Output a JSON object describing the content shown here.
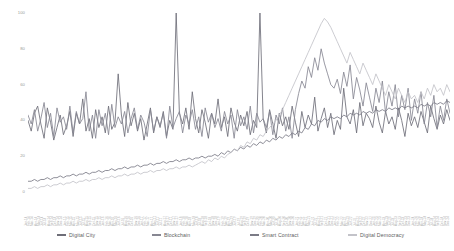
{
  "chart_data": {
    "type": "line",
    "title": "",
    "subtitle": "",
    "xlabel": "",
    "ylabel": "",
    "ylim": [
      0,
      100
    ],
    "yticks": [
      0,
      20,
      40,
      60,
      80,
      100
    ],
    "ytick_labels": [
      "0",
      "20",
      "40",
      "60",
      "80",
      "100"
    ],
    "grid": false,
    "legend_position": "bottom",
    "x": [
      "Jan-14",
      "Feb-14",
      "Mar-14",
      "Apr-14",
      "May-14",
      "Jun-14",
      "Jul-14",
      "Aug-14",
      "Sep-14",
      "Oct-14",
      "Nov-14",
      "Dec-14",
      "Jan-15",
      "Feb-15",
      "Mar-15",
      "Apr-15",
      "May-15",
      "Jun-15",
      "Jul-15",
      "Aug-15",
      "Sep-15",
      "Oct-15",
      "Nov-15",
      "Dec-15",
      "Jan-16",
      "Feb-16",
      "Mar-16",
      "Apr-16",
      "May-16",
      "Jun-16",
      "Jul-16",
      "Aug-16",
      "Sep-16",
      "Oct-16",
      "Nov-16",
      "Dec-16",
      "Jan-17",
      "Feb-17",
      "Mar-17",
      "Apr-17",
      "May-17",
      "Jun-17",
      "Jul-17",
      "Aug-17",
      "Sep-17",
      "Oct-17",
      "Nov-17",
      "Dec-17",
      "Jan-18",
      "Feb-18",
      "Mar-18",
      "Apr-18",
      "May-18",
      "Jun-18",
      "Jul-18",
      "Aug-18",
      "Sep-18",
      "Oct-18",
      "Nov-18",
      "Dec-18",
      "Jan-19",
      "Feb-19",
      "Mar-19",
      "Apr-19",
      "May-19",
      "Jun-19",
      "Jul-19",
      "Aug-19",
      "Sep-19",
      "Oct-19",
      "Nov-19",
      "Dec-19",
      "Jan-20",
      "Feb-20",
      "Mar-20",
      "Apr-20",
      "May-20",
      "Jun-20",
      "Jul-20",
      "Aug-20",
      "Sep-20",
      "Oct-20",
      "Nov-20",
      "Dec-20",
      "Jan-21",
      "Feb-21",
      "Mar-21",
      "Apr-21",
      "May-21",
      "Jun-21",
      "Jul-21",
      "Aug-21",
      "Sep-21",
      "Oct-21",
      "Nov-21",
      "Dec-21",
      "Jan-22",
      "Feb-22",
      "Mar-22",
      "Apr-22",
      "May-22",
      "Jun-22",
      "Jul-22",
      "Aug-22",
      "Sep-22",
      "Oct-22",
      "Nov-22",
      "Dec-22",
      "Jan-23",
      "Feb-23",
      "Mar-23",
      "Apr-23",
      "May-23",
      "Jun-23",
      "Jul-23",
      "Aug-23",
      "Sep-23",
      "Oct-23",
      "Nov-23",
      "Dec-23",
      "Jan-24",
      "Feb-24",
      "Mar-24",
      "Apr-24",
      "May-24",
      "Jun-24",
      "Jul-24",
      "Aug-24",
      "Sep-24",
      "Oct-24",
      "Nov-24",
      "Dec-24"
    ],
    "series": [
      {
        "name": "Digital City",
        "color": "#6e6e78",
        "values": [
          40,
          34,
          44,
          48,
          38,
          30,
          47,
          39,
          29,
          36,
          43,
          32,
          37,
          45,
          31,
          44,
          38,
          52,
          34,
          41,
          30,
          46,
          36,
          42,
          33,
          48,
          35,
          39,
          66,
          43,
          31,
          50,
          37,
          44,
          34,
          41,
          29,
          38,
          47,
          33,
          42,
          36,
          45,
          31,
          40,
          35,
          100,
          44,
          38,
          47,
          35,
          56,
          41,
          33,
          46,
          39,
          30,
          44,
          38,
          52,
          36,
          42,
          31,
          47,
          39,
          34,
          43,
          37,
          45,
          32,
          40,
          36,
          100,
          41,
          33,
          46,
          38,
          30,
          44,
          37,
          42,
          35,
          48,
          39,
          31,
          45,
          36,
          43,
          38,
          53,
          34,
          41,
          47,
          36,
          44,
          32,
          40,
          35,
          58,
          42,
          38,
          46,
          33,
          50,
          37,
          44,
          41,
          36,
          48,
          39,
          33,
          45,
          38,
          42,
          35,
          47,
          40,
          31,
          44,
          37,
          42,
          36,
          45,
          39,
          33,
          48,
          41,
          35,
          43,
          38,
          46,
          40
        ]
      },
      {
        "name": "Blockchain",
        "color": "#878792",
        "values": [
          43,
          38,
          46,
          34,
          41,
          50,
          36,
          44,
          31,
          47,
          39,
          42,
          35,
          48,
          33,
          45,
          38,
          41,
          56,
          34,
          43,
          30,
          46,
          37,
          44,
          32,
          49,
          36,
          42,
          38,
          45,
          33,
          41,
          47,
          35,
          43,
          39,
          31,
          46,
          34,
          42,
          37,
          44,
          30,
          48,
          36,
          41,
          45,
          33,
          43,
          38,
          46,
          35,
          42,
          31,
          47,
          39,
          44,
          36,
          41,
          34,
          45,
          38,
          43,
          30,
          46,
          37,
          42,
          35,
          48,
          33,
          44,
          39,
          41,
          36,
          45,
          32,
          43,
          38,
          47,
          34,
          42,
          30,
          46,
          55,
          62,
          58,
          70,
          64,
          75,
          68,
          80,
          72,
          66,
          60,
          58,
          63,
          55,
          67,
          59,
          71,
          52,
          64,
          57,
          48,
          61,
          53,
          45,
          58,
          50,
          62,
          44,
          56,
          48,
          60,
          42,
          54,
          46,
          58,
          40,
          52,
          44,
          56,
          38,
          50,
          42,
          54,
          36,
          48,
          40,
          52,
          44
        ]
      },
      {
        "name": "Smart Contract",
        "color": "#7b7b86",
        "values": [
          6,
          6,
          7,
          6,
          7,
          7,
          8,
          7,
          8,
          8,
          9,
          8,
          9,
          9,
          10,
          9,
          10,
          10,
          11,
          10,
          11,
          11,
          12,
          11,
          12,
          12,
          13,
          12,
          13,
          13,
          14,
          13,
          14,
          14,
          15,
          14,
          15,
          15,
          16,
          15,
          16,
          16,
          17,
          16,
          17,
          17,
          18,
          17,
          18,
          18,
          19,
          18,
          19,
          19,
          20,
          19,
          20,
          20,
          21,
          20,
          22,
          21,
          23,
          22,
          24,
          23,
          25,
          24,
          26,
          25,
          27,
          26,
          28,
          27,
          29,
          28,
          30,
          29,
          31,
          30,
          32,
          31,
          33,
          32,
          34,
          33,
          36,
          35,
          38,
          37,
          40,
          39,
          41,
          40,
          42,
          41,
          42,
          41,
          43,
          42,
          44,
          43,
          44,
          43,
          45,
          44,
          45,
          44,
          46,
          45,
          46,
          45,
          47,
          46,
          47,
          46,
          48,
          47,
          48,
          47,
          48,
          47,
          49,
          48,
          49,
          48,
          50,
          49,
          50,
          49,
          51,
          50
        ]
      },
      {
        "name": "Digital Democracy",
        "color": "#c3c3c9",
        "values": [
          2,
          2,
          3,
          2,
          3,
          3,
          4,
          3,
          4,
          4,
          5,
          4,
          5,
          5,
          6,
          5,
          6,
          6,
          7,
          6,
          7,
          7,
          8,
          7,
          8,
          8,
          9,
          8,
          9,
          9,
          10,
          9,
          10,
          10,
          11,
          10,
          11,
          11,
          12,
          11,
          12,
          12,
          13,
          12,
          13,
          13,
          14,
          13,
          14,
          14,
          15,
          14,
          15,
          16,
          17,
          16,
          18,
          17,
          19,
          18,
          20,
          19,
          21,
          22,
          24,
          23,
          26,
          25,
          28,
          27,
          30,
          29,
          32,
          31,
          34,
          36,
          38,
          40,
          43,
          46,
          50,
          54,
          58,
          62,
          66,
          70,
          74,
          78,
          82,
          86,
          90,
          94,
          97,
          95,
          92,
          88,
          84,
          80,
          76,
          72,
          78,
          74,
          70,
          66,
          72,
          68,
          64,
          60,
          66,
          62,
          58,
          54,
          60,
          56,
          52,
          58,
          54,
          50,
          56,
          52,
          54,
          50,
          56,
          52,
          58,
          54,
          60,
          56,
          58,
          54,
          60,
          56
        ]
      }
    ]
  },
  "legend": {
    "items": [
      {
        "label": "Digital City",
        "color": "#6e6e78"
      },
      {
        "label": "Blockchain",
        "color": "#878792"
      },
      {
        "label": "Smart Contract",
        "color": "#7b7b86"
      },
      {
        "label": "Digital Democracy",
        "color": "#c3c3c9"
      }
    ]
  }
}
